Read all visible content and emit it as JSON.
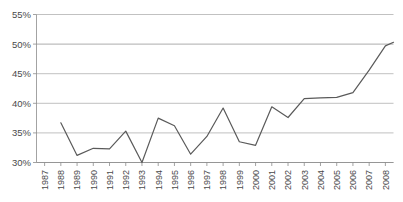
{
  "chart_data": {
    "type": "line",
    "title": "",
    "subtitle": "",
    "xlabel": "",
    "ylabel": "",
    "grid": true,
    "legend": false,
    "legend_position": "none",
    "line_color": "#5a5a5a",
    "grid_color": "#a6a6a6",
    "background_color": "#ffffff",
    "ylim": [
      30,
      55
    ],
    "ytick_labels": [
      "55%",
      "50%",
      "45%",
      "40%",
      "35%",
      "30%"
    ],
    "ytick_values": [
      55,
      50,
      45,
      40,
      35,
      30
    ],
    "categories": [
      "1987",
      "1988",
      "1989",
      "1990",
      "1991",
      "1992",
      "1993",
      "1994",
      "1995",
      "1996",
      "1997",
      "1998",
      "1999",
      "2000",
      "2001",
      "2002",
      "2003",
      "2004",
      "2005",
      "2006",
      "2007",
      "2008"
    ],
    "values": [
      null,
      36.7,
      31.2,
      32.4,
      32.3,
      35.3,
      30.0,
      37.5,
      36.2,
      31.4,
      34.4,
      39.2,
      33.5,
      32.9,
      39.4,
      37.6,
      40.8,
      40.9,
      41.0,
      41.8,
      45.6,
      49.7
    ],
    "series": [
      {
        "name": "",
        "values": [
          null,
          36.7,
          31.2,
          32.4,
          32.3,
          35.3,
          30.0,
          37.5,
          36.2,
          31.4,
          34.4,
          39.2,
          33.5,
          32.9,
          39.4,
          37.6,
          40.8,
          40.9,
          41.0,
          41.8,
          45.6,
          49.7
        ]
      }
    ],
    "end_extension_value": 50.3
  }
}
